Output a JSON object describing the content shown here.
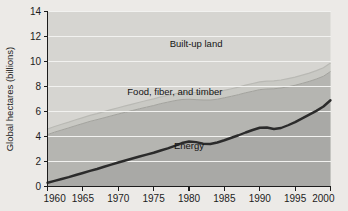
{
  "chart_data": {
    "type": "area",
    "stacked": true,
    "title": "",
    "xlabel": "",
    "ylabel": "Global hectares (billions)",
    "xlim": [
      1960,
      2000
    ],
    "ylim": [
      0,
      14
    ],
    "ytick_values": [
      0,
      2,
      4,
      6,
      8,
      10,
      12,
      14
    ],
    "ytick_labels": [
      "0",
      "2",
      "4",
      "6",
      "8",
      "10",
      "12",
      "14"
    ],
    "xtick_values": [
      1960,
      1965,
      1970,
      1975,
      1980,
      1985,
      1990,
      1995,
      2000
    ],
    "xtick_labels": [
      "1960",
      "1965",
      "1970",
      "1975",
      "1980",
      "1985",
      "1990",
      "1995",
      "2000"
    ],
    "grid": "horizontal-white",
    "legend": "inline-annotations",
    "x": [
      1960,
      1961,
      1962,
      1963,
      1964,
      1965,
      1966,
      1967,
      1968,
      1969,
      1970,
      1971,
      1972,
      1973,
      1974,
      1975,
      1976,
      1977,
      1978,
      1979,
      1980,
      1981,
      1982,
      1983,
      1984,
      1985,
      1986,
      1987,
      1988,
      1989,
      1990,
      1991,
      1992,
      1993,
      1994,
      1995,
      1996,
      1997,
      1998,
      1999,
      2000
    ],
    "series": [
      {
        "name": "Energy",
        "color": "#a9a9a6",
        "line_color": "#2b2b2b",
        "values": [
          0.3,
          0.45,
          0.6,
          0.75,
          0.92,
          1.08,
          1.25,
          1.4,
          1.58,
          1.75,
          1.92,
          2.08,
          2.24,
          2.4,
          2.55,
          2.7,
          2.88,
          3.05,
          3.25,
          3.48,
          3.6,
          3.55,
          3.42,
          3.4,
          3.52,
          3.7,
          3.9,
          4.1,
          4.32,
          4.52,
          4.7,
          4.72,
          4.6,
          4.68,
          4.9,
          5.15,
          5.45,
          5.75,
          6.05,
          6.4,
          6.9
        ]
      },
      {
        "name": "Food, fiber, and timber",
        "color": "#b5b5b1",
        "values": [
          3.85,
          3.9,
          3.92,
          3.94,
          3.95,
          3.96,
          3.96,
          3.95,
          3.92,
          3.9,
          3.88,
          3.86,
          3.84,
          3.82,
          3.8,
          3.78,
          3.75,
          3.7,
          3.62,
          3.48,
          3.38,
          3.4,
          3.5,
          3.52,
          3.46,
          3.4,
          3.32,
          3.25,
          3.18,
          3.1,
          3.05,
          3.08,
          3.22,
          3.2,
          3.08,
          2.95,
          2.8,
          2.66,
          2.55,
          2.42,
          2.3
        ]
      },
      {
        "name": "Built-up land",
        "color": "#c9c9c4",
        "values": [
          0.45,
          0.45,
          0.46,
          0.46,
          0.47,
          0.47,
          0.48,
          0.48,
          0.49,
          0.5,
          0.5,
          0.51,
          0.51,
          0.52,
          0.53,
          0.53,
          0.54,
          0.54,
          0.55,
          0.56,
          0.56,
          0.57,
          0.57,
          0.58,
          0.59,
          0.59,
          0.6,
          0.6,
          0.61,
          0.62,
          0.62,
          0.63,
          0.63,
          0.64,
          0.65,
          0.65,
          0.66,
          0.66,
          0.67,
          0.68,
          0.68
        ]
      }
    ],
    "totals": [
      4.6,
      4.8,
      4.98,
      5.15,
      5.34,
      5.51,
      5.69,
      5.83,
      5.99,
      6.15,
      6.3,
      6.45,
      6.59,
      6.74,
      6.88,
      7.01,
      7.17,
      7.29,
      7.42,
      7.52,
      7.54,
      7.52,
      7.49,
      7.5,
      7.57,
      7.69,
      7.82,
      7.95,
      8.11,
      8.24,
      8.37,
      8.43,
      8.45,
      8.52,
      8.63,
      8.75,
      8.91,
      9.07,
      9.27,
      9.5,
      9.88
    ],
    "annotations": [
      {
        "label": "Built-up land",
        "x": 1981,
        "y": 11.2
      },
      {
        "label": "Food, fiber, and timber",
        "x": 1978,
        "y": 7.3
      },
      {
        "label": "Energy",
        "x": 1980,
        "y": 3.0
      }
    ],
    "colors": {
      "background": "#eceae7",
      "plot_background": "#d6d5d1",
      "gridline": "#f2f2f0",
      "axis": "#1c1c1c",
      "energy_line": "#2b2b2b",
      "energy_fill": "#a9a9a6",
      "food_fill": "#b5b5b1",
      "builtup_fill": "#c9c9c4"
    }
  }
}
